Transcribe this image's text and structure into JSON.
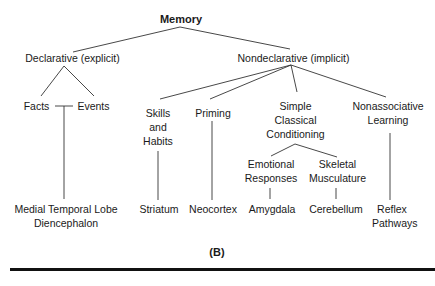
{
  "diagram": {
    "root": "Memory",
    "branches": {
      "declarative": "Declarative (explicit)",
      "nondeclarative": "Nondeclarative (implicit)"
    },
    "declarative_children": [
      "Facts",
      "Events"
    ],
    "nondeclarative_children": {
      "skills": "Skills\nand\nHabits",
      "priming": "Priming",
      "conditioning": "Simple\nClassical\nConditioning",
      "nonassociative": "Nonassociative\nLearning"
    },
    "conditioning_children": {
      "emotional": "Emotional\nResponses",
      "skeletal": "Skeletal\nMusculature"
    },
    "structures": {
      "medial": "Medial Temporal Lobe\nDiencephalon",
      "striatum": "Striatum",
      "neocortex": "Neocortex",
      "amygdala": "Amygdala",
      "cerebellum": "Cerebellum",
      "reflex": "Reflex\nPathways"
    },
    "panel_label": "(B)"
  }
}
